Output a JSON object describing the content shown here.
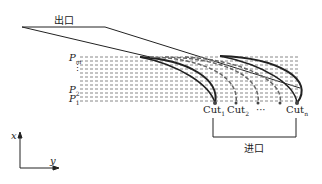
{
  "labels": {
    "outlet": "出口",
    "inlet": "进口",
    "p_m": "P",
    "p_m_sub": "m",
    "p_2": "P",
    "p_2_sub": "2",
    "p_1": "P",
    "p_1_sub": "1",
    "vdots": "⋮",
    "cut1": "Cut",
    "cut1_sub": "1",
    "cut2": "Cut",
    "cut2_sub": "2",
    "ellipsis": "···",
    "cutn": "Cut",
    "cutn_sub": "n",
    "axis_x": "x",
    "axis_y": "y"
  },
  "colors": {
    "line": "#222222",
    "dash": "#888888",
    "curve_gray": "#666666"
  }
}
